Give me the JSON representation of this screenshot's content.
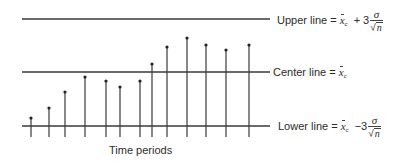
{
  "chart_data": {
    "type": "control-chart",
    "title": "",
    "xlabel": "Time periods",
    "ylabel": "",
    "colors": {
      "line": "#3a3a3a",
      "text": "#2a2a2a",
      "background": "#ffffff"
    },
    "reference_lines": [
      {
        "name": "upper",
        "label": "Upper line = x̄c + 3 σ/√n",
        "y_px": 19
      },
      {
        "name": "center",
        "label": "Center line = x̄c",
        "y_px": 72
      },
      {
        "name": "lower",
        "label": "Lower line = x̄c − 3 σ/√n",
        "y_px": 126
      }
    ],
    "points": [
      {
        "period": 1,
        "x_px": 31,
        "top_px": 118
      },
      {
        "period": 2,
        "x_px": 49,
        "top_px": 108
      },
      {
        "period": 3,
        "x_px": 65,
        "top_px": 92
      },
      {
        "period": 4,
        "x_px": 85,
        "top_px": 77
      },
      {
        "period": 5,
        "x_px": 106,
        "top_px": 81
      },
      {
        "period": 6,
        "x_px": 120,
        "top_px": 87
      },
      {
        "period": 7,
        "x_px": 140,
        "top_px": 81
      },
      {
        "period": 8,
        "x_px": 152,
        "top_px": 64
      },
      {
        "period": 9,
        "x_px": 167,
        "top_px": 47
      },
      {
        "period": 10,
        "x_px": 187,
        "top_px": 38
      },
      {
        "period": 11,
        "x_px": 206,
        "top_px": 45
      },
      {
        "period": 12,
        "x_px": 226,
        "top_px": 50
      },
      {
        "period": 13,
        "x_px": 249,
        "top_px": 45
      }
    ],
    "stem_bottom_px": 137,
    "line_x_range_px": [
      22,
      270
    ],
    "grid": false,
    "legend": "none"
  },
  "labels": {
    "upper_prefix": "Upper line = ",
    "center_prefix": "Center line = ",
    "lower_prefix": "Lower line = ",
    "x_symbol": "x",
    "sub_c": "c",
    "plus_three": "+ 3",
    "minus_three": "−3",
    "sigma": "σ",
    "n": "n",
    "sqrt_sign": "√",
    "x_axis_label": "Time periods"
  }
}
